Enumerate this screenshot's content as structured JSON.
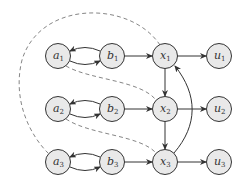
{
  "diagram": {
    "type": "directed-graph",
    "nodes": [
      {
        "id": "a1",
        "base": "a",
        "sub": "1",
        "x": 58,
        "y": 56
      },
      {
        "id": "b1",
        "base": "b",
        "sub": "1",
        "x": 112,
        "y": 56
      },
      {
        "id": "x1",
        "base": "x",
        "sub": "1",
        "x": 165,
        "y": 56
      },
      {
        "id": "u1",
        "base": "u",
        "sub": "1",
        "x": 219,
        "y": 56
      },
      {
        "id": "a2",
        "base": "a",
        "sub": "2",
        "x": 58,
        "y": 109
      },
      {
        "id": "b2",
        "base": "b",
        "sub": "2",
        "x": 112,
        "y": 109
      },
      {
        "id": "x2",
        "base": "x",
        "sub": "2",
        "x": 165,
        "y": 109
      },
      {
        "id": "u2",
        "base": "u",
        "sub": "2",
        "x": 219,
        "y": 109
      },
      {
        "id": "a3",
        "base": "a",
        "sub": "3",
        "x": 58,
        "y": 162
      },
      {
        "id": "b3",
        "base": "b",
        "sub": "3",
        "x": 112,
        "y": 162
      },
      {
        "id": "x3",
        "base": "x",
        "sub": "3",
        "x": 165,
        "y": 162
      },
      {
        "id": "u3",
        "base": "u",
        "sub": "3",
        "x": 219,
        "y": 162
      }
    ],
    "edges": [
      {
        "from": "a1",
        "to": "b1",
        "style": "solid"
      },
      {
        "from": "b1",
        "to": "a1",
        "style": "solid"
      },
      {
        "from": "b1",
        "to": "x1",
        "style": "solid"
      },
      {
        "from": "x1",
        "to": "u1",
        "style": "solid"
      },
      {
        "from": "x1",
        "to": "x2",
        "style": "solid"
      },
      {
        "from": "a2",
        "to": "b2",
        "style": "solid"
      },
      {
        "from": "b2",
        "to": "a2",
        "style": "solid"
      },
      {
        "from": "b2",
        "to": "x2",
        "style": "solid"
      },
      {
        "from": "x2",
        "to": "u2",
        "style": "solid"
      },
      {
        "from": "x2",
        "to": "x3",
        "style": "solid"
      },
      {
        "from": "a3",
        "to": "b3",
        "style": "solid"
      },
      {
        "from": "b3",
        "to": "a3",
        "style": "solid"
      },
      {
        "from": "b3",
        "to": "x3",
        "style": "solid"
      },
      {
        "from": "x3",
        "to": "u3",
        "style": "solid"
      },
      {
        "from": "x3",
        "to": "x1",
        "style": "solid-curved"
      },
      {
        "from": "x1",
        "to": "a3",
        "style": "dashed"
      },
      {
        "from": "a1",
        "to": "x2",
        "style": "dashed"
      },
      {
        "from": "a2",
        "to": "x3",
        "style": "dashed"
      }
    ]
  }
}
